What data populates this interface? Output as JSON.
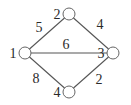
{
  "diagram": {
    "type": "weighted-undirected-graph",
    "nodes": [
      {
        "id": "1",
        "label": "1",
        "cx": 25,
        "cy": 53,
        "label_x": 13,
        "label_y": 53
      },
      {
        "id": "2",
        "label": "2",
        "cx": 69,
        "cy": 14,
        "label_x": 57,
        "label_y": 14
      },
      {
        "id": "3",
        "label": "3",
        "cx": 113,
        "cy": 53,
        "label_x": 101,
        "label_y": 53
      },
      {
        "id": "4",
        "label": "4",
        "cx": 69,
        "cy": 92,
        "label_x": 57,
        "label_y": 92
      }
    ],
    "edges": [
      {
        "from": "1",
        "to": "2",
        "weight": "5",
        "label_x": 39,
        "label_y": 27
      },
      {
        "from": "2",
        "to": "3",
        "weight": "4",
        "label_x": 100,
        "label_y": 24
      },
      {
        "from": "1",
        "to": "3",
        "weight": "6",
        "label_x": 66,
        "label_y": 44
      },
      {
        "from": "1",
        "to": "4",
        "weight": "8",
        "label_x": 36,
        "label_y": 78
      },
      {
        "from": "4",
        "to": "3",
        "weight": "2",
        "label_x": 99,
        "label_y": 79
      }
    ],
    "node_radius": 6
  }
}
